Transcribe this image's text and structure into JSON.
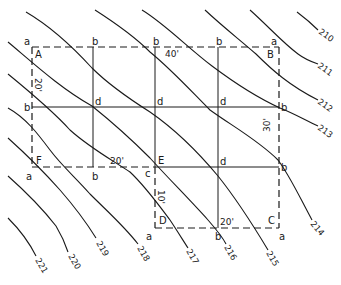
{
  "diagram": {
    "stroke_color": "#1a1a1a",
    "background": "#ffffff",
    "corner_labels": {
      "A": "A",
      "B": "B",
      "C": "C",
      "D": "D",
      "E": "E",
      "F": "F"
    },
    "dimensions": {
      "top": "40'",
      "left": "20'",
      "right": "30'",
      "middle": "20'",
      "short_vertical": "10'",
      "bottom": "20'"
    },
    "point_labels": {
      "top": [
        "a",
        "b",
        "b",
        "b",
        "a"
      ],
      "row2": [
        "b",
        "d",
        "d",
        "d",
        "b"
      ],
      "row3": [
        "a",
        "b",
        "c",
        "d",
        "b"
      ],
      "bottom": [
        "a",
        "b",
        "a"
      ]
    },
    "contours": [
      "210",
      "211",
      "212",
      "213",
      "214",
      "215",
      "216",
      "217",
      "218",
      "219",
      "220",
      "221"
    ]
  }
}
